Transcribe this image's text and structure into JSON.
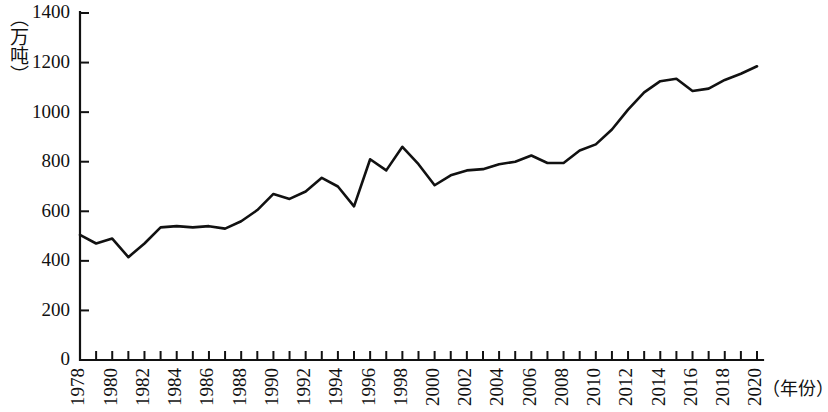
{
  "chart_data": {
    "type": "line",
    "title": "",
    "xlabel": "（年份）",
    "ylabel": "（万吨）",
    "xlim": [
      1978,
      2020
    ],
    "ylim": [
      0,
      1400
    ],
    "grid": false,
    "legend": false,
    "y_ticks": [
      0,
      200,
      400,
      600,
      800,
      1000,
      1200,
      1400
    ],
    "y_tick_labels": [
      "0",
      "200",
      "400",
      "600",
      "800",
      "1000",
      "1200",
      "1400"
    ],
    "x_ticks": [
      1978,
      1980,
      1982,
      1984,
      1986,
      1988,
      1990,
      1992,
      1994,
      1996,
      1998,
      2000,
      2002,
      2004,
      2006,
      2008,
      2010,
      2012,
      2014,
      2016,
      2018,
      2020
    ],
    "x_tick_labels": [
      "1978",
      "1980",
      "1982",
      "1984",
      "1986",
      "1988",
      "1990",
      "1992",
      "1994",
      "1996",
      "1998",
      "2000",
      "2002",
      "2004",
      "2006",
      "2008",
      "2010",
      "2012",
      "2014",
      "2016",
      "2018",
      "2020"
    ],
    "x_minor_ticks": [
      1979,
      1981,
      1983,
      1985,
      1987,
      1989,
      1991,
      1993,
      1995,
      1997,
      1999,
      2001,
      2003,
      2005,
      2007,
      2009,
      2011,
      2013,
      2015,
      2017,
      2019
    ],
    "series": [
      {
        "name": "产量",
        "color": "#111111",
        "x": [
          1978,
          1979,
          1980,
          1981,
          1982,
          1983,
          1984,
          1985,
          1986,
          1987,
          1988,
          1989,
          1990,
          1991,
          1992,
          1993,
          1994,
          1995,
          1996,
          1997,
          1998,
          1999,
          2000,
          2001,
          2002,
          2003,
          2004,
          2005,
          2006,
          2007,
          2008,
          2009,
          2010,
          2011,
          2012,
          2013,
          2014,
          2015,
          2016,
          2017,
          2018,
          2019,
          2020
        ],
        "values": [
          505,
          470,
          490,
          415,
          470,
          535,
          540,
          535,
          540,
          530,
          560,
          605,
          670,
          650,
          680,
          735,
          700,
          620,
          810,
          765,
          860,
          790,
          705,
          745,
          765,
          770,
          790,
          800,
          825,
          795,
          795,
          845,
          870,
          930,
          1010,
          1080,
          1125,
          1135,
          1085,
          1095,
          1130,
          1155,
          1185
        ]
      }
    ]
  },
  "axes": {
    "y_unit_caption": "（万吨）",
    "x_unit_caption": "（年份）"
  }
}
